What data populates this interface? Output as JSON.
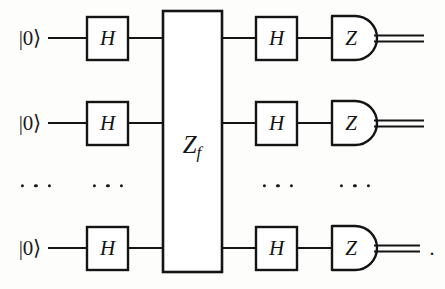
{
  "figure": {
    "type": "quantum-circuit-diagram",
    "name": "Deutsch-Jozsa / Bernstein-Vazirani circuit",
    "background_color": "#fdfdfb",
    "ink_color": "#141414",
    "width": 445,
    "height": 289,
    "trailing_punctuation": "."
  },
  "geometry": {
    "row_y": [
      38,
      123,
      248
    ],
    "ellipsis_row_y": 186,
    "wire_start_x": 55,
    "wire_end_x": 424,
    "stroke_width": 2.2,
    "classical_wire_gap": 5
  },
  "columns": {
    "input": {
      "x": 30
    },
    "hadamard_1": {
      "x": 87,
      "width": 41
    },
    "oracle": {
      "x": 163,
      "width": 59,
      "top": 11,
      "bottom": 272
    },
    "hadamard_2": {
      "x": 256,
      "width": 41
    },
    "measure": {
      "x": 332,
      "width": 44
    }
  },
  "qubits": [
    {
      "index": 0,
      "input_label": "|0⟩",
      "hadamard_1_label": "H",
      "hadamard_2_label": "H",
      "measure_label": "Z",
      "output_wire": "classical-double-line"
    },
    {
      "index": 1,
      "input_label": "|0⟩",
      "hadamard_1_label": "H",
      "hadamard_2_label": "H",
      "measure_label": "Z",
      "output_wire": "classical-double-line"
    },
    {
      "index": 2,
      "input_label": "|0⟩",
      "hadamard_1_label": "H",
      "hadamard_2_label": "H",
      "measure_label": "Z",
      "output_wire": "classical-double-line"
    }
  ],
  "oracle": {
    "label_main": "Z",
    "label_sub": "f",
    "label_full": "Z_f",
    "center_x": 192,
    "center_y": 147
  },
  "ellipses": [
    {
      "name": "input-ellipsis",
      "x": 36,
      "y": 186,
      "count": 3
    },
    {
      "name": "hadamard-1-ellipsis",
      "x": 108,
      "y": 186,
      "count": 3
    },
    {
      "name": "hadamard-2-ellipsis",
      "x": 278,
      "y": 186,
      "count": 3
    },
    {
      "name": "measure-ellipsis",
      "x": 355,
      "y": 186,
      "count": 3
    }
  ],
  "trailing_period": {
    "x": 432,
    "y": 248,
    "text": "."
  }
}
